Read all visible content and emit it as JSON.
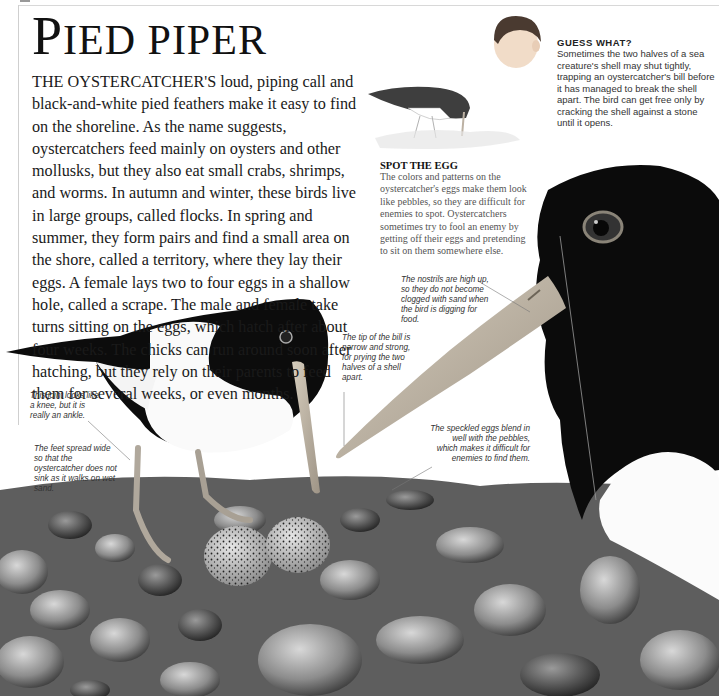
{
  "page": {
    "title_first_letter": "P",
    "title_rest": "IED PIPER",
    "intro": "THE OYSTERCATCHER'S loud, piping call and black-and-white pied feathers make it easy to find on the shoreline. As the name suggests, oystercatchers feed mainly on oysters and other mollusks, but they also eat small crabs, shrimps, and worms. In autumn and winter, these birds live in large groups, called flocks. In spring and summer, they form pairs and find a small area on the shore, called a territory, where they lay their eggs. A female lays two to four eggs in a shallow hole, called a scrape. The male and female take turns sitting on the eggs, which hatch after about four weeks. The chicks can run around soon after hatching, but they rely on their parents to feed them for several weeks, or even months."
  },
  "guess_what": {
    "heading": "GUESS WHAT?",
    "body": "Sometimes the two halves of a sea creature's shell may shut tightly, trapping an oystercatcher's bill before it has managed to break the shell apart. The bird can get free only by cracking the shell against a stone until it opens."
  },
  "spot_the_egg": {
    "heading": "SPOT THE EGG",
    "body": "The colors and patterns on the oystercatcher's eggs make them look like pebbles, so they are difficult for enemies to spot. Oystercatchers sometimes try to fool an enemy by getting off their eggs and pretending to sit on them somewhere else."
  },
  "captions": {
    "nostrils": "The nostrils are high up, so they do not become clogged with sand when the bird is digging for food.",
    "bill_tip": "The tip of the bill is narrow and strong, for prying the two halves of a shell apart.",
    "eggs": "The speckled eggs blend in well with the pebbles, which makes it difficult for enemies to find them.",
    "joint": "This joint looks like a knee, but it is really an ankle.",
    "feet": "The feet spread wide so that the oystercatcher does not sink as it walks on wet sand."
  },
  "illustrations": {
    "child_head": "child-head-illustration",
    "small_bird": "oystercatcher-sketch",
    "main_bird": "oystercatcher-photo",
    "closeup_bird": "oystercatcher-head-closeup",
    "eggs": "speckled-eggs",
    "pebbles": "pebble-beach"
  },
  "colors": {
    "plumage": "#0c0c0c",
    "bill": "#c9bfae",
    "eye_ring": "#8a8478",
    "pebble_dark": "#4a4a4a",
    "pebble_light": "#b8b8b8",
    "rule": "#cfcfcf"
  }
}
